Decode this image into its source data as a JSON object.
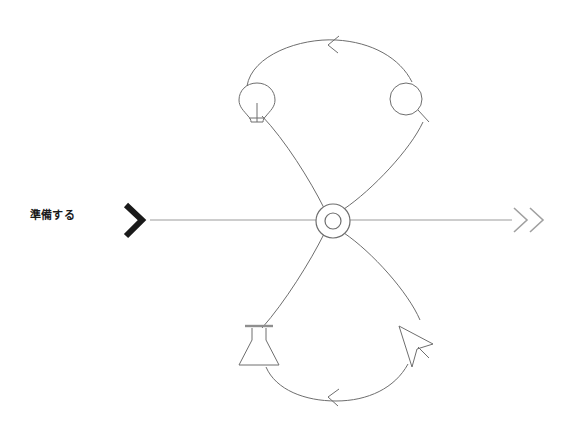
{
  "diagram": {
    "type": "cycle-loop",
    "title_label": "準備する",
    "orientation": "horizontal-axis-with-figure-eight",
    "colors": {
      "stroke": "#6e6e6e",
      "axis": "#8a8a8a",
      "label_text": "#1a1a1a",
      "start_chevron": "#1a1a1a",
      "end_chevron": "#9a9a9a",
      "background": "#ffffff"
    },
    "axis": {
      "start_marker": "chevron-right-bold",
      "end_marker": "double-chevron-right",
      "line_y": 220,
      "line_start_x": 150,
      "line_end_x": 510
    },
    "hub": {
      "name": "center-ring-node",
      "cx": 333,
      "cy": 221,
      "outer_radius": 17,
      "inner_radius": 8
    },
    "loops": [
      {
        "name": "upper-loop",
        "direction": "counter-clockwise",
        "arrow_direction": "left",
        "arrow_x": 333,
        "arrow_y": 44
      },
      {
        "name": "lower-loop",
        "direction": "counter-clockwise",
        "arrow_direction": "left",
        "arrow_x": 333,
        "arrow_y": 396
      }
    ],
    "nodes": [
      {
        "id": "idea",
        "icon": "lightbulb-icon",
        "position": "upper-left",
        "cx": 257,
        "cy": 102
      },
      {
        "id": "research",
        "icon": "magnifier-icon",
        "position": "upper-right",
        "cx": 408,
        "cy": 100
      },
      {
        "id": "experiment",
        "icon": "flask-icon",
        "position": "lower-left",
        "cx": 259,
        "cy": 343
      },
      {
        "id": "act",
        "icon": "cursor-pointer-icon",
        "position": "lower-right",
        "cx": 410,
        "cy": 342
      }
    ]
  }
}
